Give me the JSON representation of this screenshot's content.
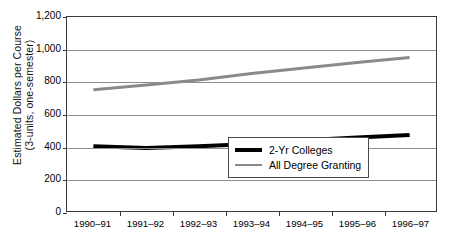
{
  "chart_data": {
    "type": "line",
    "title": "",
    "xlabel": "",
    "ylabel_line1": "Estimated Dollars per Course",
    "ylabel_line2": "(3-units, one-semester)",
    "categories": [
      "1990–91",
      "1991–92",
      "1992–93",
      "1993–94",
      "1994–95",
      "1995–96",
      "1996–97"
    ],
    "yticks": [
      "0",
      "200",
      "400",
      "600",
      "800",
      "1,000",
      "1,200"
    ],
    "ytick_values": [
      0,
      200,
      400,
      600,
      800,
      1000,
      1200
    ],
    "ylim": [
      0,
      1200
    ],
    "grid": true,
    "legend_position": "lower-right-inside",
    "series": [
      {
        "name": "2-Yr Colleges",
        "color": "#000000",
        "width": 4,
        "values": [
          400,
          390,
          400,
          415,
          437,
          455,
          470
        ]
      },
      {
        "name": "All Degree Granting",
        "color": "#8a8a8a",
        "width": 3,
        "values": [
          750,
          780,
          810,
          850,
          885,
          918,
          950
        ]
      }
    ]
  },
  "legend": {
    "items": [
      {
        "label": "2-Yr Colleges",
        "swatch": "thick-black-line"
      },
      {
        "label": "All Degree Granting",
        "swatch": "thin-gray-line"
      }
    ]
  }
}
